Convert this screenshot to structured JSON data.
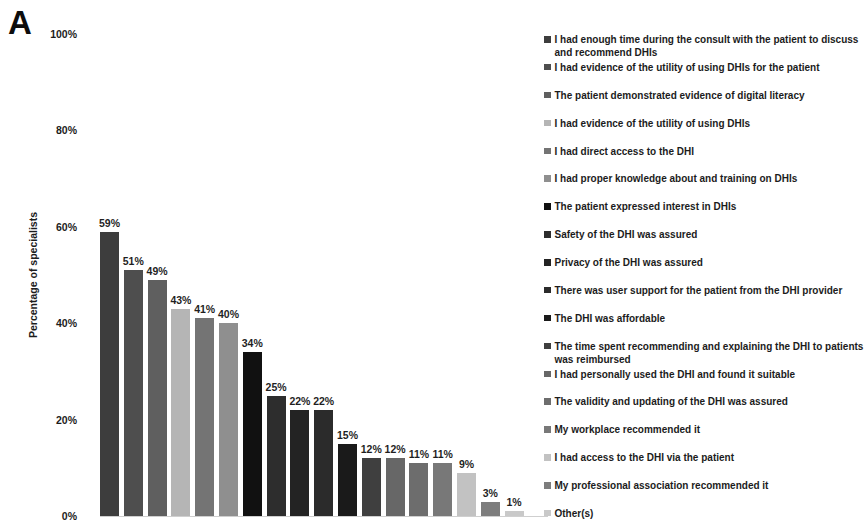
{
  "panel_label": "A",
  "chart_data": {
    "type": "bar",
    "title": "",
    "xlabel": "",
    "ylabel": "Percentage of specialists",
    "ylim": [
      0,
      100
    ],
    "grid": false,
    "legend_position": "right",
    "axis_line_color": "#cfcfcf",
    "background_color": "#ffffff",
    "ytick_labels": [
      "100%",
      "80%",
      "60%",
      "40%",
      "20%",
      "0%"
    ],
    "ytick_values": [
      100,
      80,
      60,
      40,
      20,
      0
    ],
    "categories": [
      "I had enough time during the consult with the patient to discuss and recommend DHIs",
      "I had evidence of the utility of using DHIs for the patient",
      "The patient demonstrated evidence of digital literacy",
      "I had evidence of the utility of using DHIs",
      "I had direct access to the DHI",
      "I had proper knowledge about and training on DHIs",
      "The patient expressed interest in DHIs",
      "Safety of the DHI  was assured",
      "Privacy of the DHI was assured",
      "There was user support for the patient from the DHI provider",
      "The DHI was affordable",
      "The time spent recommending and explaining the DHI to patients was reimbursed",
      "I had personally used the DHI and found it suitable",
      "The validity and updating of the DHI  was assured",
      "My workplace recommended it",
      "I had access to the DHI via the patient",
      "My professional association recommended it",
      "Other(s)"
    ],
    "values": [
      59,
      51,
      49,
      43,
      41,
      40,
      34,
      25,
      22,
      22,
      15,
      12,
      12,
      11,
      11,
      9,
      3,
      1
    ],
    "data_labels": [
      "59%",
      "51%",
      "49%",
      "43%",
      "41%",
      "40%",
      "34%",
      "25%",
      "22%",
      "22%",
      "15%",
      "12%",
      "12%",
      "11%",
      "11%",
      "9%",
      "3%",
      "1%"
    ],
    "bar_colors": [
      "#3d3d3d",
      "#4e4e4e",
      "#5f5f5f",
      "#b5b5b5",
      "#747474",
      "#8f8f8f",
      "#111111",
      "#2d2d2d",
      "#232323",
      "#2b2b2b",
      "#1a1a1a",
      "#3f3f3f",
      "#676767",
      "#6d6d6d",
      "#787878",
      "#c2c2c2",
      "#7d7d7d",
      "#c9c9c9"
    ]
  }
}
